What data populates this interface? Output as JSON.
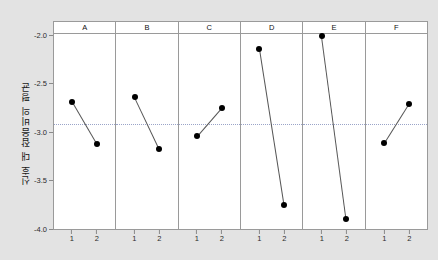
{
  "chart_data": {
    "type": "line",
    "title": "",
    "subtitle": "",
    "xlabel": "",
    "ylabel": "신호 대 잡음비의 평균",
    "ylim": [
      -4.0,
      -2.0
    ],
    "yticks": [
      -2.0,
      -2.5,
      -3.0,
      -3.5,
      -4.0
    ],
    "ytick_labels": [
      "-2.0",
      "-2.5",
      "-3.0",
      "-3.5",
      "-4.0"
    ],
    "x": [
      1,
      2
    ],
    "xtick_labels": [
      "1",
      "2"
    ],
    "grid": false,
    "legend": "none",
    "reference_line": {
      "value": -2.92,
      "style": "dotted",
      "color": "#9aa4c8",
      "orientation": "horizontal"
    },
    "marker": {
      "shape": "circle",
      "color": "#000000",
      "size": 3
    },
    "line": {
      "color": "#555555",
      "width": 1
    },
    "panel_label_key": "factor",
    "panels": [
      {
        "label": "A",
        "values": [
          -2.7,
          -3.13
        ]
      },
      {
        "label": "B",
        "values": [
          -2.65,
          -3.18
        ]
      },
      {
        "label": "C",
        "values": [
          -3.05,
          -2.76
        ]
      },
      {
        "label": "D",
        "values": [
          -2.15,
          -3.75
        ]
      },
      {
        "label": "E",
        "values": [
          -2.02,
          -3.9
        ]
      },
      {
        "label": "F",
        "values": [
          -3.12,
          -2.72
        ]
      }
    ]
  },
  "figure": {
    "background_color": "#e3e3e3",
    "panel_background_color": "#ffffff",
    "border_color": "#9a9a9a"
  }
}
